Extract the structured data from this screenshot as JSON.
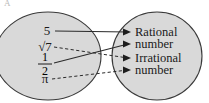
{
  "figure": {
    "corner_mark": "A",
    "background_color": "#ffffff",
    "set_fill_color": "#d9d9d9",
    "set_stroke_color": "#3a3a3a",
    "line_color": "#2b2b2b",
    "text_color": "#1a1a1a"
  },
  "domain_set": {
    "name": "numbers-set",
    "elements": [
      {
        "id": "five",
        "label": "5",
        "kind": "integer",
        "x": 47,
        "y": 34
      },
      {
        "id": "sqrt7",
        "label": "√7",
        "kind": "radical",
        "x": 45,
        "y": 50
      },
      {
        "id": "one-half",
        "numerator": "1",
        "denominator": "2",
        "kind": "fraction",
        "x": 45,
        "y": 66
      },
      {
        "id": "pi",
        "label": "π",
        "kind": "constant",
        "x": 45,
        "y": 81
      }
    ]
  },
  "range_set": {
    "name": "classification-set",
    "targets": [
      {
        "id": "rational",
        "line1": "Rational",
        "line2": "number",
        "x": 142,
        "y": 37
      },
      {
        "id": "irrational",
        "line1": "Irrational",
        "line2": "number",
        "x": 142,
        "y": 63
      }
    ]
  },
  "mappings": [
    {
      "from": "five",
      "to": "rational",
      "style": "solid",
      "arrow_index": 1
    },
    {
      "from": "sqrt7",
      "to": "irrational",
      "style": "dashed",
      "arrow_index": 3
    },
    {
      "from": "one-half",
      "to": "rational",
      "style": "solid",
      "arrow_index": 2
    },
    {
      "from": "pi",
      "to": "irrational",
      "style": "dashed",
      "arrow_index": 4
    }
  ],
  "arrow_tips": [
    {
      "index": 1,
      "x": 131,
      "y": 32
    },
    {
      "index": 2,
      "x": 131,
      "y": 44
    },
    {
      "index": 3,
      "x": 131,
      "y": 58
    },
    {
      "index": 4,
      "x": 131,
      "y": 70
    }
  ]
}
